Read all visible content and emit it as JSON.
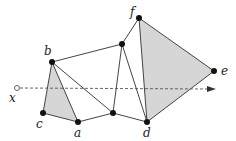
{
  "diagram": {
    "colors": {
      "edge": "#444444",
      "fill": "#d6d6d6",
      "vertex": "#111111",
      "ray": "#555555"
    },
    "vertices": [
      {
        "id": "b",
        "x": 52,
        "y": 62,
        "label": "b",
        "lx": 44,
        "ly": 55
      },
      {
        "id": "c",
        "x": 43,
        "y": 113,
        "label": "c",
        "lx": 36,
        "ly": 128
      },
      {
        "id": "a",
        "x": 78,
        "y": 122,
        "label": "a",
        "lx": 74,
        "ly": 137
      },
      {
        "id": "g",
        "x": 113,
        "y": 113,
        "label": "",
        "lx": 0,
        "ly": 0
      },
      {
        "id": "h",
        "x": 122,
        "y": 44,
        "label": "",
        "lx": 0,
        "ly": 0
      },
      {
        "id": "f",
        "x": 139,
        "y": 18,
        "label": "f",
        "lx": 130,
        "ly": 16
      },
      {
        "id": "e",
        "x": 214,
        "y": 71,
        "label": "e",
        "lx": 221,
        "ly": 75
      },
      {
        "id": "d",
        "x": 147,
        "y": 122,
        "label": "d",
        "lx": 143,
        "ly": 137
      }
    ],
    "shaded_triangles": [
      [
        "b",
        "c",
        "a"
      ],
      [
        "f",
        "e",
        "d"
      ]
    ],
    "edges": [
      [
        "b",
        "c"
      ],
      [
        "c",
        "a"
      ],
      [
        "a",
        "b"
      ],
      [
        "b",
        "g"
      ],
      [
        "a",
        "g"
      ],
      [
        "b",
        "h"
      ],
      [
        "h",
        "g"
      ],
      [
        "h",
        "d"
      ],
      [
        "h",
        "f"
      ],
      [
        "g",
        "d"
      ],
      [
        "f",
        "d"
      ],
      [
        "f",
        "e"
      ],
      [
        "e",
        "d"
      ]
    ],
    "ray": {
      "label": "x",
      "x1": 17,
      "y1": 88,
      "x2": 216,
      "y2": 89,
      "lx": 9,
      "ly": 102
    }
  }
}
